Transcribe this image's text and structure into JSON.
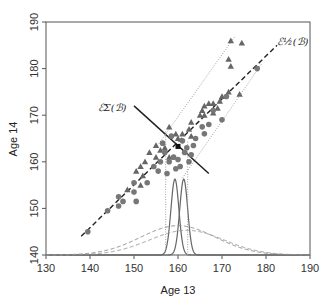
{
  "chart_data": {
    "type": "scatter",
    "title": "",
    "xlabel": "Age 13",
    "ylabel": "Age 14",
    "xlim": [
      130,
      190
    ],
    "ylim": [
      140,
      190
    ],
    "xticks": [
      130,
      140,
      150,
      160,
      170,
      180,
      190
    ],
    "yticks": [
      140,
      150,
      160,
      170,
      180,
      190
    ],
    "grid": false,
    "legend": null,
    "annotations": [
      {
        "text": "ℰ_Σ(ℬ)",
        "display": "ℰΣ(ℬ)",
        "x": 145,
        "y": 171,
        "arrow_to": [
          157.5,
          166
        ]
      },
      {
        "text": "ℰ_{1/2}(ℬ)",
        "display": "ℰ½(ℬ)",
        "x": 182.5,
        "y": 185
      }
    ],
    "series": [
      {
        "name": "triangles",
        "marker": "triangle",
        "color": "#666666",
        "points": [
          [
            172,
            186
          ],
          [
            174.5,
            185.5
          ],
          [
            171.5,
            182
          ],
          [
            172,
            180.5
          ],
          [
            174,
            174.5
          ],
          [
            171.5,
            175
          ],
          [
            170,
            174
          ],
          [
            169.5,
            173
          ],
          [
            169,
            171.5
          ],
          [
            168,
            172.5
          ],
          [
            167,
            172.5
          ],
          [
            166,
            172
          ],
          [
            165.5,
            171
          ],
          [
            165,
            170
          ],
          [
            166,
            170
          ],
          [
            163,
            168.5
          ],
          [
            162.5,
            167
          ],
          [
            161,
            166
          ],
          [
            160,
            165
          ],
          [
            159.5,
            166
          ],
          [
            158,
            167.5
          ],
          [
            155,
            163.5
          ],
          [
            153.5,
            162
          ],
          [
            152.5,
            160
          ],
          [
            155,
            161
          ],
          [
            156,
            162.5
          ],
          [
            151.5,
            159
          ],
          [
            150.5,
            158
          ],
          [
            152,
            157
          ],
          [
            151.5,
            155
          ],
          [
            148.5,
            154
          ],
          [
            157,
            163
          ],
          [
            158,
            161
          ],
          [
            163,
            165.5
          ],
          [
            168,
            170.5
          ]
        ]
      },
      {
        "name": "circles",
        "marker": "circle",
        "color": "#777777",
        "points": [
          [
            178,
            180
          ],
          [
            171,
            174
          ],
          [
            168,
            171
          ],
          [
            164,
            165
          ],
          [
            165.5,
            167.5
          ],
          [
            167,
            168
          ],
          [
            170,
            169
          ],
          [
            163.5,
            163.5
          ],
          [
            162,
            163
          ],
          [
            161.5,
            162
          ],
          [
            160,
            160.5
          ],
          [
            159,
            161
          ],
          [
            158,
            160
          ],
          [
            160.5,
            159
          ],
          [
            159.5,
            158.5
          ],
          [
            157,
            162
          ],
          [
            156,
            160
          ],
          [
            155.5,
            158
          ],
          [
            157.5,
            157.5
          ],
          [
            154.5,
            159
          ],
          [
            156.5,
            164
          ],
          [
            153,
            155.5
          ],
          [
            150,
            155.5
          ],
          [
            150,
            153.5
          ],
          [
            150.5,
            151.5
          ],
          [
            147.5,
            151.5
          ],
          [
            146.5,
            150.5
          ],
          [
            146.5,
            152.5
          ],
          [
            144,
            149.5
          ],
          [
            139.5,
            145
          ],
          [
            162.5,
            160
          ],
          [
            163,
            161.5
          ],
          [
            166,
            166
          ],
          [
            161,
            164.5
          ],
          [
            158.5,
            165.5
          ]
        ]
      }
    ],
    "lines": [
      {
        "name": "principal-axis",
        "style": "dashed",
        "color": "#222222",
        "from": [
          138,
          144
        ],
        "to": [
          182.5,
          185
        ]
      },
      {
        "name": "upper-band",
        "style": "dotted",
        "color": "#999999",
        "from": [
          155,
          163
        ],
        "to": [
          173,
          187
        ]
      },
      {
        "name": "lower-band",
        "style": "dotted",
        "color": "#999999",
        "from": [
          161,
          156.5
        ],
        "to": [
          179,
          181
        ]
      },
      {
        "name": "sigma-ellipse-minor-axis",
        "style": "solid",
        "color": "#222222",
        "from": [
          150,
          172
        ],
        "to": [
          167,
          157.5
        ]
      },
      {
        "name": "vline-left",
        "style": "dotted",
        "color": "#999999",
        "from": [
          157.2,
          140
        ],
        "to": [
          157.2,
          166.5
        ]
      },
      {
        "name": "vline-right",
        "style": "dotted",
        "color": "#999999",
        "from": [
          162.2,
          140
        ],
        "to": [
          162.2,
          164.5
        ]
      }
    ],
    "density_curves": [
      {
        "name": "narrow-left",
        "style": "solid",
        "color": "#666666",
        "mean": 159.3,
        "sd": 0.9,
        "peak": 156.3
      },
      {
        "name": "narrow-right",
        "style": "solid",
        "color": "#666666",
        "mean": 161.3,
        "sd": 0.9,
        "peak": 156.3
      },
      {
        "name": "wide-upper",
        "style": "dashed",
        "color": "#888888",
        "mean": 160,
        "sd": 8.5,
        "peak": 146.3
      },
      {
        "name": "wide-lower",
        "style": "dashed",
        "color": "#999999",
        "mean": 162,
        "sd": 8.5,
        "peak": 145.3
      }
    ],
    "baseline": 140
  },
  "colors": {
    "axis": "#555555",
    "background": "#ffffff"
  }
}
